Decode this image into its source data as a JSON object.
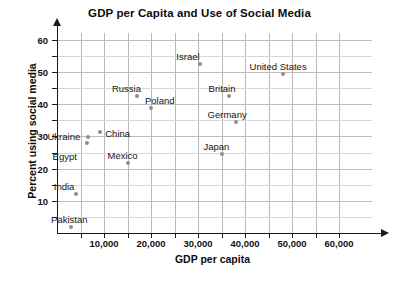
{
  "chart_data": {
    "type": "scatter",
    "title": "GDP per Capita and Use of Social Media",
    "xlabel": "GDP per capita",
    "ylabel": "Percent using social media",
    "xlim": [
      0,
      63000
    ],
    "ylim": [
      0,
      63
    ],
    "x_ticks_major": [
      10000,
      20000,
      30000,
      40000,
      50000,
      60000
    ],
    "x_tick_labels": [
      "10,000",
      "20,000",
      "30,000",
      "40,000",
      "50,000",
      "60,000"
    ],
    "x_tick_step_minor": 5000,
    "y_ticks_major": [
      10,
      20,
      30,
      40,
      50,
      60
    ],
    "y_tick_labels": [
      "10",
      "20",
      "30",
      "40",
      "50",
      "60"
    ],
    "y_tick_step_minor": 5,
    "grid": true,
    "legend": "none",
    "marker_color": "#8e8e8e",
    "points": [
      {
        "label": "Israel",
        "x": 30500,
        "y": 52.5,
        "label_dx": -24,
        "label_dy": -13
      },
      {
        "label": "United States",
        "x": 48000,
        "y": 49.5,
        "label_dx": -33,
        "label_dy": -13
      },
      {
        "label": "Russia",
        "x": 17000,
        "y": 42.5,
        "label_dx": -25,
        "label_dy": -13
      },
      {
        "label": "Britain",
        "x": 36500,
        "y": 42.5,
        "label_dx": -20,
        "label_dy": -13
      },
      {
        "label": "Poland",
        "x": 20000,
        "y": 38.7,
        "label_dx": -6,
        "label_dy": -13
      },
      {
        "label": "Germany",
        "x": 38000,
        "y": 34.5,
        "label_dx": -28,
        "label_dy": -13
      },
      {
        "label": "China",
        "x": 9200,
        "y": 31.5,
        "label_dx": 5,
        "label_dy": -4
      },
      {
        "label": "Ukraine",
        "x": 6700,
        "y": 29.8,
        "label_dx": -41,
        "label_dy": -6
      },
      {
        "label": "Egypt",
        "x": 6300,
        "y": 28.0,
        "label_dx": -34,
        "label_dy": 8
      },
      {
        "label": "Japan",
        "x": 35000,
        "y": 24.5,
        "label_dx": -18,
        "label_dy": -13
      },
      {
        "label": "Mexico",
        "x": 15000,
        "y": 21.8,
        "label_dx": -20,
        "label_dy": -13
      },
      {
        "label": "India",
        "x": 4000,
        "y": 12.0,
        "label_dx": -22,
        "label_dy": -13
      },
      {
        "label": "Pakistan",
        "x": 3000,
        "y": 2.0,
        "label_dx": -20,
        "label_dy": -13
      }
    ]
  }
}
